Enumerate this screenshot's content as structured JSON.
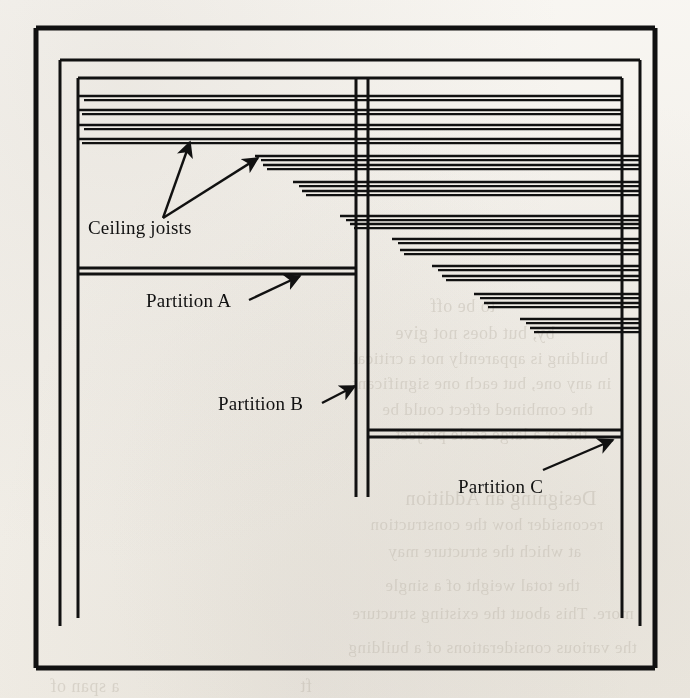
{
  "figure": {
    "kind": "architectural-floor-plan",
    "labels": {
      "ceiling_joists": "Ceiling joists",
      "partition_a": "Partition A",
      "partition_b": "Partition B",
      "partition_c": "Partition C"
    },
    "colors": {
      "ink": "#111111",
      "paper": "#fbfaf8",
      "bleed_through": "#b9b2a6"
    },
    "walls": {
      "outer": {
        "x1": 36,
        "y1": 28,
        "x2": 655,
        "y2": 668,
        "stroke": 5
      },
      "middle": {
        "x1": 60,
        "y1": 60,
        "x2": 640,
        "y2": 626,
        "stroke": 3
      },
      "inner": {
        "x1": 78,
        "y1": 78,
        "x2": 622,
        "y2": 618,
        "stroke": 3
      }
    },
    "partitions": [
      {
        "id": "A",
        "orientation": "horizontal",
        "y1": 268,
        "y2": 274,
        "x1": 78,
        "x2": 356
      },
      {
        "id": "B",
        "orientation": "vertical",
        "x1": 356,
        "x2": 368,
        "y1": 78,
        "y2": 497
      },
      {
        "id": "C",
        "orientation": "horizontal",
        "y1": 430,
        "y2": 437,
        "x1": 368,
        "x2": 622
      }
    ],
    "joists": {
      "note": "Each joist drawn as a pair of closely-spaced lines; left ends step progressively right going down, all ending at the right wall.",
      "pairs": [
        {
          "y": 96,
          "x_left": 78,
          "x_right": 622
        },
        {
          "y": 110,
          "x_left": 78,
          "x_right": 622
        },
        {
          "y": 125,
          "x_left": 78,
          "x_right": 622
        },
        {
          "y": 139,
          "x_left": 78,
          "x_right": 622
        },
        {
          "y": 156,
          "x_left": 255,
          "x_right": 640
        },
        {
          "y": 165,
          "x_left": 263,
          "x_right": 640
        },
        {
          "y": 182,
          "x_left": 293,
          "x_right": 640
        },
        {
          "y": 191,
          "x_left": 302,
          "x_right": 640
        },
        {
          "y": 216,
          "x_left": 340,
          "x_right": 640
        },
        {
          "y": 224,
          "x_left": 350,
          "x_right": 640
        },
        {
          "y": 239,
          "x_left": 392,
          "x_right": 640
        },
        {
          "y": 250,
          "x_left": 400,
          "x_right": 640
        },
        {
          "y": 266,
          "x_left": 432,
          "x_right": 640
        },
        {
          "y": 276,
          "x_left": 442,
          "x_right": 640
        },
        {
          "y": 294,
          "x_left": 474,
          "x_right": 640
        },
        {
          "y": 303,
          "x_left": 484,
          "x_right": 640
        },
        {
          "y": 319,
          "x_left": 520,
          "x_right": 640
        },
        {
          "y": 328,
          "x_left": 530,
          "x_right": 640
        }
      ]
    },
    "leaders": [
      {
        "for": "ceiling_joists",
        "from": [
          163,
          218
        ],
        "to": [
          190,
          142
        ]
      },
      {
        "for": "ceiling_joists",
        "from": [
          163,
          218
        ],
        "to": [
          258,
          158
        ]
      },
      {
        "for": "partition_a",
        "from": [
          249,
          300
        ],
        "to": [
          300,
          276
        ]
      },
      {
        "for": "partition_b",
        "from": [
          322,
          403
        ],
        "to": [
          355,
          386
        ]
      },
      {
        "for": "partition_c",
        "from": [
          543,
          470
        ],
        "to": [
          613,
          440
        ]
      }
    ],
    "label_positions": {
      "ceiling_joists": {
        "x": 88,
        "y": 234
      },
      "partition_a": {
        "x": 146,
        "y": 307
      },
      "partition_b": {
        "x": 218,
        "y": 410
      },
      "partition_c": {
        "x": 458,
        "y": 493
      }
    },
    "bleed_text": [
      {
        "text": "to be off",
        "x": 430,
        "y": 296,
        "size": 18
      },
      {
        "text": "by, but does not give",
        "x": 395,
        "y": 323,
        "size": 18
      },
      {
        "text": "building is apparently not a critical",
        "x": 352,
        "y": 349,
        "size": 17
      },
      {
        "text": "in any one, but each one significant",
        "x": 352,
        "y": 374,
        "size": 17
      },
      {
        "text": "the combined effect could be",
        "x": 382,
        "y": 400,
        "size": 17
      },
      {
        "text": "the or a large scale project",
        "x": 395,
        "y": 425,
        "size": 17
      },
      {
        "text": "Designing an Addition",
        "x": 405,
        "y": 487,
        "size": 20
      },
      {
        "text": "reconsider how the construction",
        "x": 370,
        "y": 515,
        "size": 17
      },
      {
        "text": "at which the structure may",
        "x": 388,
        "y": 542,
        "size": 17
      },
      {
        "text": "the total weight of a single",
        "x": 385,
        "y": 576,
        "size": 17
      },
      {
        "text": "more. This about the existing structure",
        "x": 352,
        "y": 604,
        "size": 17
      },
      {
        "text": "the various considerations of a building",
        "x": 348,
        "y": 638,
        "size": 17
      },
      {
        "text": "a span of",
        "x": 50,
        "y": 676,
        "size": 18
      },
      {
        "text": "ft",
        "x": 300,
        "y": 676,
        "size": 18
      }
    ]
  }
}
